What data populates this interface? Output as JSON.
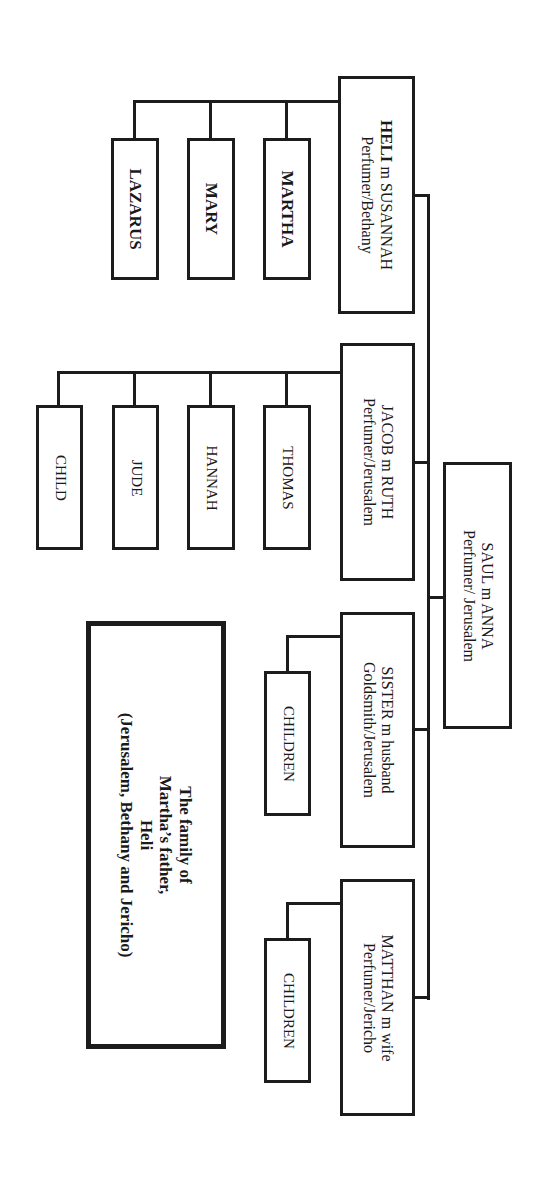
{
  "diagram": {
    "title": {
      "lines": [
        "The family of",
        "Martha’s father,",
        "Heli",
        "(Jerusalem, Bethany and Jericho)"
      ]
    },
    "root": {
      "name": "SAUL m ANNA",
      "detail": "Perfumer/ Jerusalem"
    },
    "children": [
      {
        "name_bold": "HELI",
        "name_rest": " m SUSANNAH",
        "detail": "Perfumer/Bethany",
        "children": [
          "MARTHA",
          "MARY",
          "LAZARUS"
        ]
      },
      {
        "name": "JACOB m RUTH",
        "detail": "Perfumer/Jerusalem",
        "children": [
          "THOMAS",
          "HANNAH",
          "JUDE",
          "CHILD"
        ]
      },
      {
        "name": "SISTER m husband",
        "detail": "Goldsmith/Jerusalem",
        "children": [
          "CHILDREN"
        ]
      },
      {
        "name": "MATTHAN m wife",
        "detail": "Perfumer/Jericho",
        "children": [
          "CHILDREN"
        ]
      }
    ]
  },
  "colors": {
    "line": "#1c1c1c",
    "background": "#ffffff"
  }
}
